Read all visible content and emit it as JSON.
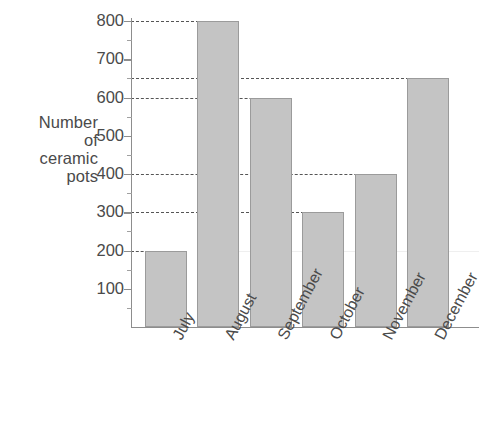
{
  "chart_data": {
    "type": "bar",
    "title": "",
    "subtitle": "",
    "xlabel": "",
    "ylabel": "Number of ceramic pots",
    "ylabel_lines": [
      "Number",
      "of",
      "ceramic",
      "pots"
    ],
    "categories": [
      "July",
      "August",
      "September",
      "October",
      "November",
      "December"
    ],
    "values": [
      200,
      800,
      600,
      300,
      400,
      650
    ],
    "ylim": [
      0,
      800
    ],
    "ytick_values": [
      100,
      200,
      300,
      400,
      500,
      600,
      700,
      800
    ],
    "ytick_labels": [
      "100",
      "200",
      "300",
      "400",
      "500",
      "600",
      "700",
      "800"
    ],
    "ytick_minor_step": 50,
    "grid": "horizontal-dashed-at-bar-tops",
    "gridline_values": [
      200,
      300,
      400,
      600,
      650,
      800
    ],
    "legend": "none",
    "bar_fill_color": "#c4c4c4",
    "bar_edge_color": "#9b9b9b",
    "axis_color": "#8d8d8d",
    "text_color": "#4a4a4a",
    "background_color": "#ffffff",
    "xtick_label_rotation_degrees": -62
  }
}
